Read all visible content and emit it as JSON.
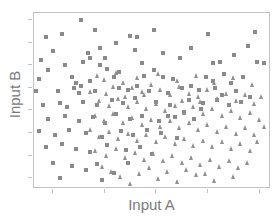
{
  "chart_data": {
    "type": "scatter",
    "title": "",
    "xlabel": "Input A",
    "ylabel": "Input B",
    "xlim": [
      0,
      100
    ],
    "ylim": [
      0,
      100
    ],
    "grid": false,
    "legend": "none",
    "axis_tick_labels": {
      "x": [],
      "y": []
    },
    "x_tick_positions": [
      8,
      30,
      52,
      74,
      96
    ],
    "y_tick_positions": [
      5,
      18,
      31,
      44,
      57,
      70,
      83,
      96
    ],
    "colors": {
      "square_series": "#8a8a8a",
      "triangle_series": "#909090",
      "frame": "#c2c2c2",
      "tick": "#c2c2c2",
      "label_text": "#7a7a7a",
      "background": "#ffffff"
    },
    "series": [
      {
        "name": "square-series",
        "marker": "square",
        "color": "#8a8a8a",
        "points": [
          [
            5,
            86
          ],
          [
            12,
            88
          ],
          [
            20,
            96
          ],
          [
            26,
            90
          ],
          [
            28,
            80
          ],
          [
            23,
            77
          ],
          [
            24,
            74
          ],
          [
            41,
            87
          ],
          [
            44,
            86
          ],
          [
            51,
            90
          ],
          [
            74,
            88
          ],
          [
            94,
            89
          ],
          [
            3,
            73
          ],
          [
            21,
            72
          ],
          [
            30,
            74
          ],
          [
            28,
            70
          ],
          [
            31,
            68
          ],
          [
            36,
            66
          ],
          [
            46,
            71
          ],
          [
            51,
            67
          ],
          [
            62,
            74
          ],
          [
            76,
            71
          ],
          [
            79,
            72
          ],
          [
            95,
            72
          ],
          [
            98,
            71
          ],
          [
            2,
            62
          ],
          [
            16,
            63
          ],
          [
            18,
            60
          ],
          [
            24,
            61
          ],
          [
            34,
            63
          ],
          [
            47,
            64
          ],
          [
            55,
            63
          ],
          [
            59,
            62
          ],
          [
            67,
            58
          ],
          [
            73,
            63
          ],
          [
            76,
            61
          ],
          [
            81,
            65
          ],
          [
            84,
            60
          ],
          [
            89,
            63
          ],
          [
            1,
            55
          ],
          [
            10,
            55
          ],
          [
            17,
            57
          ],
          [
            19,
            54
          ],
          [
            20,
            58
          ],
          [
            26,
            55
          ],
          [
            36,
            57
          ],
          [
            40,
            56
          ],
          [
            44,
            58
          ],
          [
            49,
            55
          ],
          [
            57,
            54
          ],
          [
            63,
            57
          ],
          [
            70,
            56
          ],
          [
            77,
            57
          ],
          [
            80,
            53
          ],
          [
            86,
            55
          ],
          [
            4,
            47
          ],
          [
            11,
            48
          ],
          [
            14,
            46
          ],
          [
            21,
            49
          ],
          [
            27,
            47
          ],
          [
            33,
            50
          ],
          [
            38,
            48
          ],
          [
            43,
            51
          ],
          [
            52,
            49
          ],
          [
            58,
            47
          ],
          [
            66,
            50
          ],
          [
            72,
            48
          ],
          [
            78,
            50
          ],
          [
            83,
            47
          ],
          [
            6,
            39
          ],
          [
            13,
            41
          ],
          [
            19,
            38
          ],
          [
            25,
            40
          ],
          [
            30,
            37
          ],
          [
            35,
            42
          ],
          [
            41,
            39
          ],
          [
            46,
            41
          ],
          [
            53,
            38
          ],
          [
            60,
            40
          ],
          [
            68,
            39
          ],
          [
            2,
            32
          ],
          [
            9,
            30
          ],
          [
            15,
            33
          ],
          [
            22,
            31
          ],
          [
            29,
            29
          ],
          [
            37,
            32
          ],
          [
            42,
            30
          ],
          [
            48,
            33
          ],
          [
            54,
            31
          ],
          [
            61,
            28
          ],
          [
            5,
            23
          ],
          [
            12,
            25
          ],
          [
            18,
            22
          ],
          [
            24,
            20
          ],
          [
            31,
            24
          ],
          [
            39,
            21
          ],
          [
            45,
            23
          ],
          [
            50,
            19
          ],
          [
            8,
            14
          ],
          [
            16,
            12
          ],
          [
            22,
            10
          ],
          [
            27,
            13
          ],
          [
            34,
            8
          ],
          [
            40,
            14
          ],
          [
            11,
            5
          ],
          [
            29,
            4
          ],
          [
            57,
            41
          ],
          [
            64,
            43
          ],
          [
            71,
            45
          ],
          [
            88,
            49
          ],
          [
            92,
            52
          ],
          [
            6,
            67
          ],
          [
            13,
            70
          ],
          [
            8,
            78
          ],
          [
            35,
            83
          ],
          [
            43,
            79
          ],
          [
            55,
            77
          ],
          [
            67,
            80
          ],
          [
            85,
            76
          ],
          [
            91,
            81
          ]
        ]
      },
      {
        "name": "triangle-series",
        "marker": "triangle",
        "color": "#909090",
        "points": [
          [
            30,
            62
          ],
          [
            34,
            58
          ],
          [
            38,
            60
          ],
          [
            42,
            57
          ],
          [
            46,
            55
          ],
          [
            50,
            59
          ],
          [
            54,
            56
          ],
          [
            58,
            53
          ],
          [
            62,
            58
          ],
          [
            66,
            54
          ],
          [
            70,
            52
          ],
          [
            74,
            56
          ],
          [
            78,
            51
          ],
          [
            82,
            54
          ],
          [
            86,
            50
          ],
          [
            90,
            53
          ],
          [
            94,
            48
          ],
          [
            97,
            52
          ],
          [
            28,
            50
          ],
          [
            32,
            47
          ],
          [
            36,
            51
          ],
          [
            40,
            46
          ],
          [
            44,
            49
          ],
          [
            48,
            45
          ],
          [
            52,
            48
          ],
          [
            56,
            44
          ],
          [
            60,
            47
          ],
          [
            64,
            43
          ],
          [
            68,
            46
          ],
          [
            72,
            42
          ],
          [
            76,
            45
          ],
          [
            80,
            41
          ],
          [
            84,
            44
          ],
          [
            88,
            40
          ],
          [
            92,
            43
          ],
          [
            96,
            39
          ],
          [
            26,
            41
          ],
          [
            30,
            38
          ],
          [
            34,
            42
          ],
          [
            38,
            37
          ],
          [
            42,
            40
          ],
          [
            46,
            36
          ],
          [
            50,
            39
          ],
          [
            54,
            35
          ],
          [
            58,
            38
          ],
          [
            62,
            34
          ],
          [
            66,
            37
          ],
          [
            70,
            33
          ],
          [
            74,
            36
          ],
          [
            78,
            32
          ],
          [
            82,
            35
          ],
          [
            86,
            31
          ],
          [
            90,
            34
          ],
          [
            94,
            30
          ],
          [
            24,
            33
          ],
          [
            28,
            29
          ],
          [
            32,
            32
          ],
          [
            36,
            28
          ],
          [
            40,
            31
          ],
          [
            44,
            27
          ],
          [
            48,
            30
          ],
          [
            52,
            26
          ],
          [
            56,
            29
          ],
          [
            60,
            25
          ],
          [
            64,
            28
          ],
          [
            68,
            24
          ],
          [
            72,
            27
          ],
          [
            76,
            23
          ],
          [
            80,
            26
          ],
          [
            84,
            22
          ],
          [
            88,
            25
          ],
          [
            92,
            21
          ],
          [
            26,
            21
          ],
          [
            31,
            18
          ],
          [
            35,
            22
          ],
          [
            39,
            17
          ],
          [
            43,
            20
          ],
          [
            47,
            16
          ],
          [
            51,
            19
          ],
          [
            55,
            15
          ],
          [
            59,
            18
          ],
          [
            63,
            14
          ],
          [
            67,
            17
          ],
          [
            71,
            13
          ],
          [
            75,
            16
          ],
          [
            79,
            12
          ],
          [
            83,
            15
          ],
          [
            87,
            11
          ],
          [
            91,
            14
          ],
          [
            33,
            9
          ],
          [
            37,
            6
          ],
          [
            45,
            8
          ],
          [
            53,
            5
          ],
          [
            57,
            9
          ],
          [
            61,
            3
          ],
          [
            69,
            7
          ],
          [
            77,
            4
          ],
          [
            49,
            11
          ],
          [
            65,
            10
          ],
          [
            73,
            8
          ],
          [
            29,
            12
          ],
          [
            85,
            6
          ],
          [
            41,
            2
          ],
          [
            95,
            26
          ],
          [
            98,
            35
          ],
          [
            24,
            55
          ],
          [
            27,
            64
          ],
          [
            35,
            66
          ],
          [
            44,
            63
          ],
          [
            53,
            65
          ],
          [
            61,
            61
          ],
          [
            69,
            64
          ],
          [
            77,
            60
          ],
          [
            85,
            63
          ],
          [
            93,
            59
          ],
          [
            31,
            54
          ],
          [
            39,
            52
          ],
          [
            47,
            53
          ],
          [
            63,
            50
          ],
          [
            71,
            49
          ]
        ]
      }
    ]
  },
  "axes": {
    "ylabel_text": "Input B",
    "xlabel_text": "Input A"
  }
}
